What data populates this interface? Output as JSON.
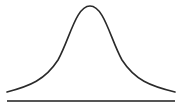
{
  "diagram": {
    "type": "bell-curve",
    "colors": {
      "curve": "#2a2a2a",
      "baseline": "#555555",
      "background": "#ffffff"
    },
    "curve": {
      "start": [
        7,
        92
      ],
      "peak": [
        90,
        6
      ],
      "end": [
        175,
        92
      ]
    },
    "baseline": {
      "y": 101,
      "x1": 7,
      "x2": 175
    }
  }
}
